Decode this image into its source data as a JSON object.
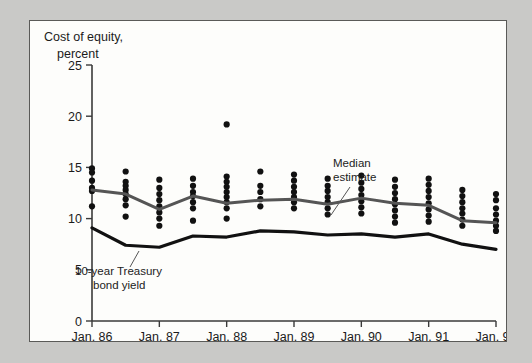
{
  "figure": {
    "title_line1": "Cost of equity,",
    "title_line2": "percent",
    "background_color": "#fdfdfb",
    "page_background_color": "#c9c9c7",
    "border_color": "#5a5a58"
  },
  "annotations": {
    "median": {
      "line1": "Median",
      "line2": "estimate"
    },
    "treasury": {
      "line1": "10-year Treasury",
      "line2": "bond yield"
    }
  },
  "chart_data": {
    "type": "scatter",
    "title": "Cost of equity, percent",
    "xlabel": "",
    "ylabel": "Cost of equity, percent",
    "ylim": [
      0,
      25
    ],
    "yticks": [
      0,
      5,
      10,
      15,
      20,
      25
    ],
    "ytick_labels": [
      "0",
      "5",
      "10",
      "15",
      "20",
      "25"
    ],
    "grid": false,
    "legend_position": "inline-annotations",
    "xtick_labels": [
      "Jan. 86",
      "Jan. 87",
      "Jan. 88",
      "Jan. 89",
      "Jan. 90",
      "Jan. 91",
      "Jan. 92"
    ],
    "xtick_values": [
      0,
      2,
      4,
      6,
      8,
      10,
      12
    ],
    "x_values": [
      0,
      1,
      2,
      3,
      4,
      5,
      6,
      7,
      8,
      9,
      10,
      11,
      12
    ],
    "x_period_labels": [
      "Jan. 86",
      "Jul. 86",
      "Jan. 87",
      "Jul. 87",
      "Jan. 88",
      "Jul. 88",
      "Jan. 89",
      "Jul. 89",
      "Jan. 90",
      "Jul. 90",
      "Jan. 91",
      "Jul. 91",
      "Jan. 92"
    ],
    "scatter_label": "Individual estimates",
    "scatter_color": "#111111",
    "scatter_points": [
      {
        "x": 0,
        "values": [
          14.9,
          14.5,
          13.7,
          13.0,
          12.7,
          11.2
        ]
      },
      {
        "x": 1,
        "values": [
          14.6,
          13.6,
          13.2,
          12.8,
          12.4,
          11.9,
          11.3,
          10.2
        ]
      },
      {
        "x": 2,
        "values": [
          13.8,
          13.0,
          12.4,
          11.8,
          11.2,
          10.6,
          10.0,
          9.3
        ]
      },
      {
        "x": 3,
        "values": [
          13.9,
          13.2,
          12.6,
          12.2,
          11.6,
          11.0,
          9.8
        ]
      },
      {
        "x": 4,
        "values": [
          14.1,
          13.6,
          13.1,
          12.6,
          12.1,
          11.6,
          11.0,
          10.0,
          19.2
        ]
      },
      {
        "x": 5,
        "values": [
          14.6,
          13.2,
          12.6,
          11.9,
          11.2
        ]
      },
      {
        "x": 6,
        "values": [
          14.3,
          13.7,
          13.1,
          12.6,
          12.1,
          11.6,
          11.0
        ]
      },
      {
        "x": 7,
        "values": [
          13.9,
          13.2,
          12.7,
          12.1,
          11.6,
          11.0,
          10.4
        ]
      },
      {
        "x": 8,
        "values": [
          14.2,
          13.5,
          12.9,
          12.3,
          11.7,
          11.1,
          10.5
        ]
      },
      {
        "x": 9,
        "values": [
          13.8,
          13.1,
          12.5,
          11.9,
          11.4,
          10.8,
          10.2,
          9.6
        ]
      },
      {
        "x": 10,
        "values": [
          13.9,
          13.3,
          12.7,
          12.1,
          11.5,
          10.9,
          10.3,
          9.7
        ]
      },
      {
        "x": 11,
        "values": [
          12.8,
          12.2,
          11.6,
          11.0,
          10.5,
          9.9,
          9.3
        ]
      },
      {
        "x": 12,
        "values": [
          12.4,
          11.8,
          11.0,
          10.4,
          9.8,
          9.3,
          8.8
        ]
      }
    ],
    "series": [
      {
        "name": "Median estimate",
        "color": "#555555",
        "values": [
          12.8,
          12.4,
          10.9,
          12.2,
          11.5,
          11.8,
          11.9,
          11.4,
          12.0,
          11.5,
          11.3,
          9.8,
          9.6
        ]
      },
      {
        "name": "10-year Treasury bond yield",
        "color": "#111111",
        "values": [
          9.1,
          7.4,
          7.2,
          8.3,
          8.2,
          8.8,
          8.7,
          8.4,
          8.5,
          8.2,
          8.5,
          7.5,
          7.0
        ]
      }
    ]
  }
}
